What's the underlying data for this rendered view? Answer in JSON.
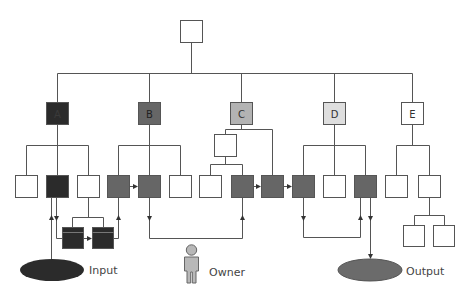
{
  "diagram": {
    "type": "hierarchy-flow",
    "colors": {
      "line": "#555555",
      "dark": "#2b2b2b",
      "medium": "#666666",
      "light": "#b3b3b3",
      "pale": "#dedede",
      "white": "#ffffff",
      "output_ellipse": "#6b6b6b",
      "input_ellipse": "#2b2b2b",
      "person": "#b8b8b8"
    },
    "root": {
      "label": ""
    },
    "categories": [
      {
        "id": "A",
        "label": "A",
        "shade": "dark"
      },
      {
        "id": "B",
        "label": "B",
        "shade": "medium"
      },
      {
        "id": "C",
        "label": "C",
        "shade": "light"
      },
      {
        "id": "D",
        "label": "D",
        "shade": "pale"
      },
      {
        "id": "E",
        "label": "E",
        "shade": "white"
      }
    ],
    "terminals": {
      "input": {
        "label": "Input"
      },
      "owner": {
        "label": "Owner"
      },
      "output": {
        "label": "Output"
      }
    }
  }
}
